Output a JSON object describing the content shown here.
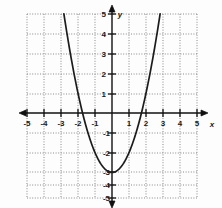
{
  "figure": {
    "title": "",
    "background_color": "#fdfdfd",
    "curve_color": "#1c1c1c",
    "grid_color": "#8a8a8a",
    "axis_color": "#101010"
  },
  "axes": {
    "x_axis_label": "x",
    "y_axis_label": "y",
    "x_ticks": [
      "-5",
      "-4",
      "-3",
      "-2",
      "-1",
      "1",
      "2",
      "3",
      "4",
      "5"
    ],
    "y_ticks": [
      "5",
      "4",
      "3",
      "2",
      "1",
      "-1",
      "-2",
      "-3",
      "-4",
      "-5"
    ]
  },
  "chart_data": {
    "type": "line",
    "title": "",
    "xlabel": "x",
    "ylabel": "y",
    "xlim": [
      -5,
      5
    ],
    "ylim": [
      -5,
      5
    ],
    "grid": true,
    "legend": "none",
    "x_ticks": [
      -5,
      -4,
      -3,
      -2,
      -1,
      0,
      1,
      2,
      3,
      4,
      5
    ],
    "y_ticks": [
      -5,
      -4,
      -3,
      -2,
      -1,
      0,
      1,
      2,
      3,
      4,
      5
    ],
    "x_tick_labels": [
      "-5",
      "-4",
      "-3",
      "-2",
      "-1",
      "",
      "1",
      "2",
      "3",
      "4",
      "5"
    ],
    "y_tick_labels": [
      "-5",
      "-4",
      "-3",
      "-2",
      "-1",
      "",
      "1",
      "2",
      "3",
      "4",
      "5"
    ],
    "series": [
      {
        "name": "y = x^2 - 3",
        "equation": "y = x^2 - 3",
        "shape": "parabola",
        "vertex": [
          0,
          -3
        ],
        "opens": "up",
        "x_intercepts": [
          -1.73,
          1.73
        ],
        "y_intercept": -3,
        "domain_drawn": [
          -2.83,
          2.83
        ],
        "x": [
          -2.83,
          -2.6,
          -2.4,
          -2.2,
          -2.0,
          -1.8,
          -1.6,
          -1.4,
          -1.2,
          -1.0,
          -0.8,
          -0.6,
          -0.4,
          -0.2,
          0,
          0.2,
          0.4,
          0.6,
          0.8,
          1.0,
          1.2,
          1.4,
          1.6,
          1.8,
          2.0,
          2.2,
          2.4,
          2.6,
          2.83
        ],
        "y": [
          5,
          3.76,
          2.76,
          1.84,
          1.0,
          0.24,
          -0.44,
          -1.04,
          -1.56,
          -2.0,
          -2.36,
          -2.64,
          -2.84,
          -2.96,
          -3.0,
          -2.96,
          -2.84,
          -2.64,
          -2.36,
          -2.0,
          -1.56,
          -1.04,
          -0.44,
          0.24,
          1.0,
          1.84,
          2.76,
          3.76,
          5
        ]
      }
    ]
  }
}
